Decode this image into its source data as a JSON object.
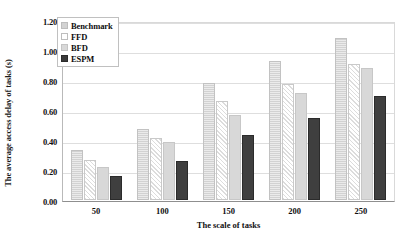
{
  "chart_data": {
    "type": "bar",
    "title": "",
    "xlabel": "The scale of tasks",
    "ylabel": "The average access delay of tasks (s)",
    "categories": [
      "50",
      "100",
      "150",
      "200",
      "250"
    ],
    "series": [
      {
        "name": "Benchmark",
        "values": [
          0.34,
          0.48,
          0.79,
          0.94,
          1.09
        ],
        "color": "#d2d2d2"
      },
      {
        "name": "FFD",
        "values": [
          0.27,
          0.42,
          0.67,
          0.78,
          0.92
        ],
        "color": "#ffffff"
      },
      {
        "name": "BFD",
        "values": [
          0.22,
          0.39,
          0.57,
          0.72,
          0.89
        ],
        "color": "#d8d8d8"
      },
      {
        "name": "ESPM",
        "values": [
          0.16,
          0.26,
          0.44,
          0.55,
          0.7
        ],
        "color": "#3a3a3a"
      }
    ],
    "ylim": [
      0.0,
      1.2
    ],
    "ytick_labels": [
      "1.20",
      "1.00",
      "0.80",
      "0.60",
      "0.40",
      "0.20",
      "0.00"
    ],
    "ytick_values": [
      1.2,
      1.0,
      0.8,
      0.6,
      0.4,
      0.2,
      0.0
    ],
    "grid": true,
    "legend_position": "top-left"
  },
  "legend": {
    "items": [
      {
        "label": "Benchmark"
      },
      {
        "label": "FFD"
      },
      {
        "label": "BFD"
      },
      {
        "label": "ESPM"
      }
    ]
  }
}
